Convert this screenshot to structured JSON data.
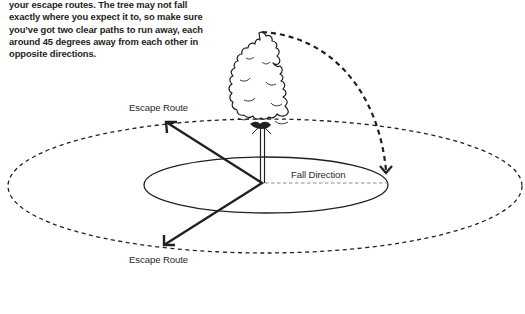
{
  "intro_text": {
    "lines": [
      "your escape routes. The tree may not fall",
      "exactly where you expect it to, so make sure",
      "you’ve got two clear paths to run away, each",
      "around 45 degrees away from each other in",
      "opposite directions."
    ]
  },
  "diagram": {
    "labels": {
      "escape_route_top": "Escape Route",
      "escape_route_bottom": "Escape Route",
      "fall_direction": "Fall Direction"
    },
    "icons": {
      "tree": "tree-icon",
      "fall_arc": "curved-dashed-arrow-icon",
      "escape_arrows": "arrow-icon"
    },
    "colors": {
      "ink": "#231f20",
      "dash_light": "#8a8a8a",
      "background": "#ffffff"
    }
  }
}
